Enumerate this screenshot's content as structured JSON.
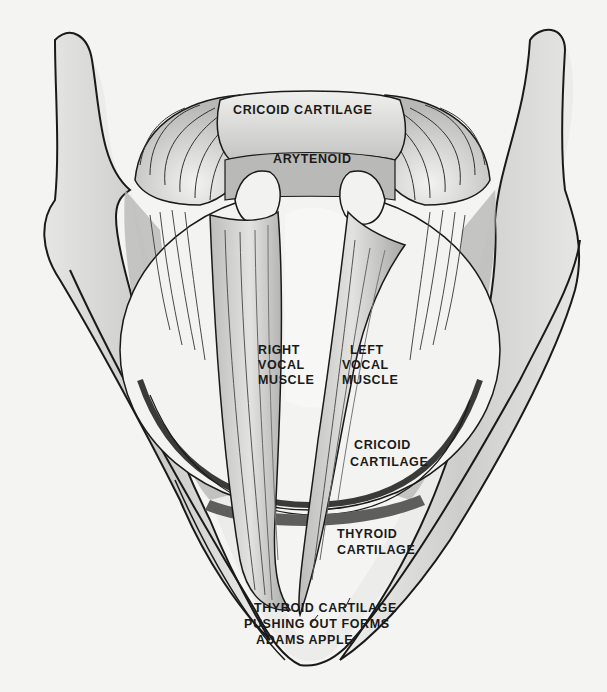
{
  "figure": {
    "colors": {
      "paper": "#f4f4f2",
      "ink": "#1a1a1a",
      "shade_light": "#d8d8d6",
      "shade_mid": "#a9a9a7",
      "shade_dark": "#5e5e5c"
    },
    "labels": {
      "cricoid_top": "CRICOID CARTILAGE",
      "arytenoid": "ARYTENOID",
      "right_vocal": [
        "RIGHT",
        "VOCAL",
        "MUSCLE"
      ],
      "left_vocal": [
        "LEFT",
        "VOCAL",
        "MUSCLE"
      ],
      "cricoid_lower": [
        "CRICOID",
        "CARTILAGE"
      ],
      "thyroid": [
        "THYROID",
        "CARTILAGE"
      ],
      "adams_apple": [
        "THYROID CARTILAGE",
        "PUSHING OUT FORMS",
        "ADAMS APPLE"
      ]
    }
  }
}
